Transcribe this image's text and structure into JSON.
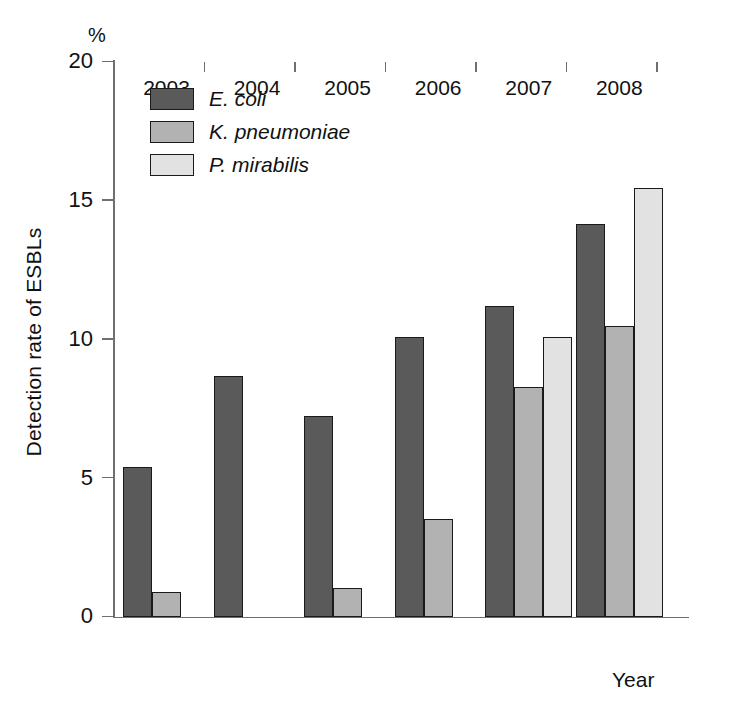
{
  "chart_data": {
    "type": "bar",
    "title": "",
    "xlabel": "Year",
    "ylabel": "Detection rate of ESBLs",
    "unit_label": "%",
    "categories": [
      "2003",
      "2004",
      "2005",
      "2006",
      "2007",
      "2008"
    ],
    "ylim": [
      0,
      20
    ],
    "yticks": [
      0,
      5,
      10,
      15,
      20
    ],
    "ytick_labels": [
      "0",
      "5",
      "10",
      "15",
      "20"
    ],
    "grid": false,
    "legend_position": "top-left-inside",
    "series": [
      {
        "name": "E. coli",
        "color": "#5a5a5a",
        "values": [
          5.4,
          8.7,
          7.25,
          10.1,
          11.2,
          14.15
        ]
      },
      {
        "name": "K. pneumoniae",
        "color": "#b2b2b2",
        "values": [
          0.9,
          0,
          1.05,
          3.55,
          8.3,
          10.5
        ]
      },
      {
        "name": "P. mirabilis",
        "color": "#e2e2e2",
        "values": [
          0,
          0,
          0,
          0,
          10.1,
          15.45
        ]
      }
    ]
  },
  "colors": {
    "axis": "#6f6f6f",
    "bar_outline": "#1a1a1a",
    "text": "#111111",
    "background": "#ffffff"
  }
}
